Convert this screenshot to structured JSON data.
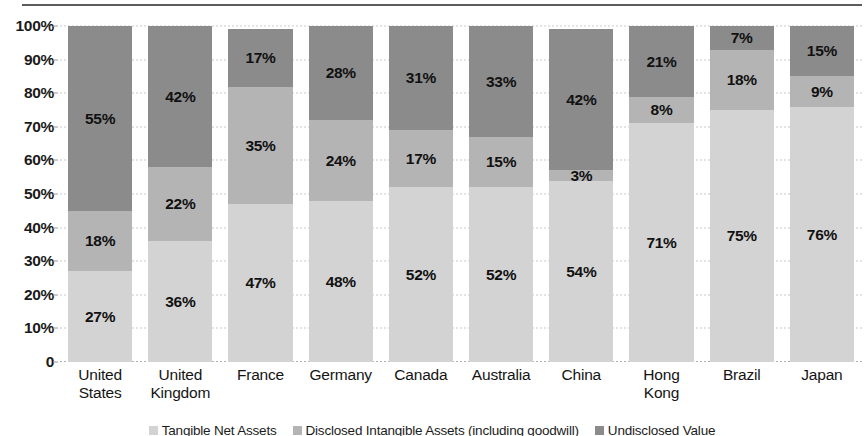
{
  "chart_data": {
    "type": "bar",
    "subtype": "stacked-percentage",
    "title": "",
    "xlabel": "",
    "ylabel": "",
    "ylim": [
      0,
      100
    ],
    "grid": true,
    "legend_position": "bottom",
    "categories": [
      "United States",
      "United Kingdom",
      "France",
      "Germany",
      "Canada",
      "Australia",
      "China",
      "Hong Kong",
      "Brazil",
      "Japan"
    ],
    "category_lines": [
      [
        "United",
        "States"
      ],
      [
        "United",
        "Kingdom"
      ],
      [
        "France",
        ""
      ],
      [
        "Germany",
        ""
      ],
      [
        "Canada",
        ""
      ],
      [
        "Australia",
        ""
      ],
      [
        "China",
        ""
      ],
      [
        "Hong",
        "Kong"
      ],
      [
        "Brazil",
        ""
      ],
      [
        "Japan",
        ""
      ]
    ],
    "ytick_labels": [
      "0",
      "10%",
      "20%",
      "30%",
      "40%",
      "50%",
      "60%",
      "70%",
      "80%",
      "90%",
      "100%"
    ],
    "ytick_values": [
      0,
      10,
      20,
      30,
      40,
      50,
      60,
      70,
      80,
      90,
      100
    ],
    "series": [
      {
        "name": "Tangible Net Assets",
        "color": "#d3d3d3",
        "values": [
          27,
          36,
          47,
          48,
          52,
          52,
          54,
          71,
          75,
          76
        ],
        "labels": [
          "27%",
          "36%",
          "47%",
          "48%",
          "52%",
          "52%",
          "54%",
          "71%",
          "75%",
          "76%"
        ]
      },
      {
        "name": "Disclosed Intangible Assets (including goodwill)",
        "color": "#b4b4b4",
        "values": [
          18,
          22,
          35,
          24,
          17,
          15,
          3,
          8,
          18,
          9
        ],
        "labels": [
          "18%",
          "22%",
          "35%",
          "24%",
          "17%",
          "15%",
          "3%",
          "8%",
          "18%",
          "9%"
        ]
      },
      {
        "name": "Undisclosed Value",
        "color": "#8b8b8b",
        "values": [
          55,
          42,
          17,
          28,
          31,
          33,
          42,
          21,
          7,
          15
        ],
        "labels": [
          "55%",
          "42%",
          "17%",
          "28%",
          "31%",
          "33%",
          "42%",
          "21%",
          "7%",
          "15%"
        ]
      }
    ]
  },
  "colors": {
    "light_gray": "#d3d3d3",
    "medium_gray": "#b4b4b4",
    "dark_gray": "#8b8b8b",
    "text": "#111111",
    "gridline": "#c9c9c9",
    "rule": "#5c5c5c"
  }
}
